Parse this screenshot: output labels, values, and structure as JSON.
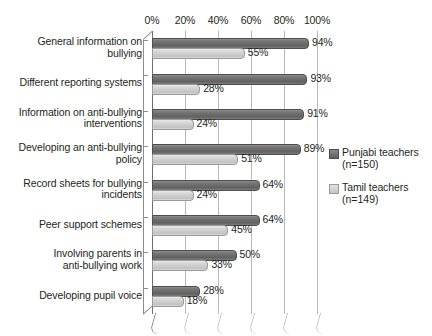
{
  "chart_data": {
    "type": "bar",
    "orientation": "horizontal",
    "title": "",
    "xlabel": "",
    "ylabel": "",
    "xlim": [
      0,
      100
    ],
    "xticks": [
      "0%",
      "20%",
      "40%",
      "60%",
      "80%",
      "100%"
    ],
    "xtick_values": [
      0,
      20,
      40,
      60,
      80,
      100
    ],
    "grid": true,
    "legend_position": "right",
    "categories": [
      "General information on bullying",
      "Different reporting systems",
      "Information on anti-bullying interventions",
      "Developing an anti-bullying policy",
      "Record sheets for bullying incidents",
      "Peer support schemes",
      "Involving parents in anti-bullying work",
      "Developing pupil voice"
    ],
    "category_lines": [
      [
        "General information on",
        "bullying"
      ],
      [
        "Different reporting systems"
      ],
      [
        "Information on anti-bullying",
        "interventions"
      ],
      [
        "Developing an anti-bullying",
        "policy"
      ],
      [
        "Record sheets for bullying",
        "incidents"
      ],
      [
        "Peer support schemes"
      ],
      [
        "Involving parents in",
        "anti-bullying work"
      ],
      [
        "Developing pupil voice"
      ]
    ],
    "series": [
      {
        "name": "Punjabi teachers (n=150)",
        "short_name": "Punjabi teachers",
        "sub_label": "(n=150)",
        "color": "#6d6d6d",
        "values": [
          94,
          93,
          91,
          89,
          64,
          64,
          50,
          28
        ],
        "labels": [
          "94%",
          "93%",
          "91%",
          "89%",
          "64%",
          "64%",
          "50%",
          "28%"
        ]
      },
      {
        "name": "Tamil teachers (n=149)",
        "short_name": "Tamil teachers",
        "sub_label": "(n=149)",
        "color": "#cdcdcd",
        "values": [
          55,
          28,
          24,
          51,
          24,
          45,
          33,
          18
        ],
        "labels": [
          "55%",
          "28%",
          "24%",
          "51%",
          "24%",
          "45%",
          "33%",
          "18%"
        ]
      }
    ]
  },
  "legend": {
    "entries": [
      {
        "name": "Punjabi teachers",
        "sub": "(n=150)",
        "swatch": "dark"
      },
      {
        "name": "Tamil teachers",
        "sub": "(n=149)",
        "swatch": "light"
      }
    ]
  },
  "colors": {
    "bar_dark": "#6d6d6d",
    "bar_light": "#cdcdcd",
    "gridline": "#b9b9b9",
    "axis": "#6f6f6f",
    "text": "#231f20",
    "background": "#ffffff"
  }
}
